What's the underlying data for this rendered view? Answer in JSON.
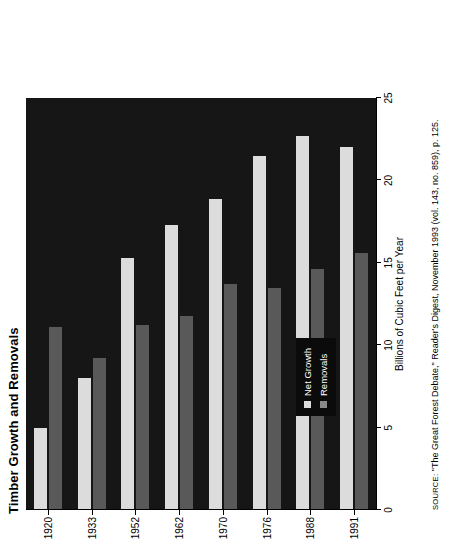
{
  "figure": {
    "title": "Timber Growth and Removals",
    "source_prefix": "SOURCE:",
    "source_text": " \"The Great Forest Debate,\" Reader's Digest, November 1993 (vol. 143, no. 859), p. 125."
  },
  "legend": {
    "position": "inside-lower-left",
    "items": [
      {
        "label": "Net Growth",
        "color": "#dcdcdc",
        "icon": "square-swatch"
      },
      {
        "label": "Removals",
        "color": "#8a8a8a",
        "icon": "square-swatch"
      }
    ]
  },
  "axes": {
    "value_axis_title": "Billions of Cubic Feet per Year",
    "value_ticks": [
      "0",
      "5",
      "10",
      "15",
      "20",
      "25"
    ],
    "value_min": 0,
    "value_max": 25,
    "category_axis_title": ""
  },
  "chart_data": {
    "type": "bar",
    "orientation": "horizontal",
    "title": "Timber Growth and Removals",
    "xlabel": "Billions of Cubic Feet per Year",
    "ylabel": "",
    "categories": [
      "1920",
      "1933",
      "1952",
      "1962",
      "1970",
      "1976",
      "1988",
      "1991"
    ],
    "series": [
      {
        "name": "Net Growth",
        "color": "#dcdcdc",
        "values": [
          5.0,
          8.0,
          15.3,
          17.3,
          18.9,
          21.5,
          22.7,
          22.0
        ]
      },
      {
        "name": "Removals",
        "color": "#595959",
        "values": [
          11.1,
          9.2,
          11.2,
          11.8,
          13.7,
          13.5,
          14.6,
          15.6
        ]
      }
    ],
    "xlim": [
      0,
      25
    ],
    "xticks": [
      0,
      5,
      10,
      15,
      20,
      25
    ],
    "grid": false,
    "legend": "inside-lower-left",
    "plot_background": "#161616",
    "figure_background": "#ffffff",
    "note": "Chart is rendered rotated 90 degrees within the page; value axis increases right-to-left in page coordinates."
  }
}
